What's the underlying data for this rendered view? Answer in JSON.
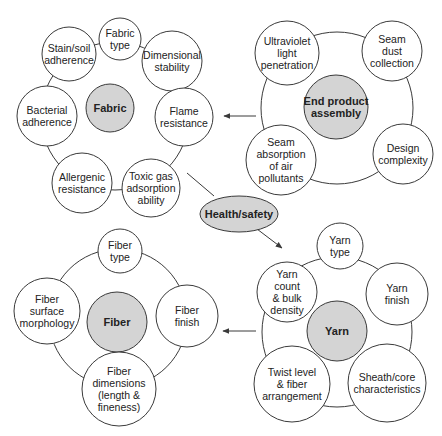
{
  "colors": {
    "line": "#3a3a3a",
    "hub_fill": "#d4d4d4",
    "node_fill": "#ffffff"
  },
  "center": {
    "label": "Health/safety",
    "cx": 239,
    "cy": 214,
    "rx": 39,
    "ry": 18
  },
  "clusters": [
    {
      "id": "fabric",
      "ring": {
        "cx": 115,
        "cy": 116,
        "r": 74
      },
      "hub": {
        "label": "Fabric",
        "cx": 110,
        "cy": 108,
        "r": 24
      },
      "nodes": [
        {
          "label": "Fabric\ntype",
          "cx": 120,
          "cy": 39,
          "r": 21
        },
        {
          "label": "Dimensional\nstability",
          "cx": 172,
          "cy": 61,
          "r": 30
        },
        {
          "label": "Flame\nresistance",
          "cx": 184,
          "cy": 117,
          "r": 29
        },
        {
          "label": "Toxic gas\nadsorption\nability",
          "cx": 151,
          "cy": 188,
          "r": 29
        },
        {
          "label": "Allergenic\nresistance",
          "cx": 82,
          "cy": 183,
          "r": 30
        },
        {
          "label": "Bacterial\nadherence",
          "cx": 47,
          "cy": 116,
          "r": 30
        },
        {
          "label": "Stain/soil\nadherence",
          "cx": 69,
          "cy": 54,
          "r": 27
        }
      ]
    },
    {
      "id": "end-product-assembly",
      "ring": {
        "cx": 337,
        "cy": 108,
        "r": 76
      },
      "hub": {
        "label": "End product\nassembly",
        "cx": 336,
        "cy": 107,
        "r": 32
      },
      "nodes": [
        {
          "label": "Ultraviolet\nlight\npenetration",
          "cx": 287,
          "cy": 53,
          "r": 32
        },
        {
          "label": "Seam\ndust\ncollection",
          "cx": 392,
          "cy": 51,
          "r": 30
        },
        {
          "label": "Design\ncomplexity",
          "cx": 403,
          "cy": 154,
          "r": 30
        },
        {
          "label": "Seam\nabsorption\nof air\npollutants",
          "cx": 281,
          "cy": 160,
          "r": 35
        }
      ]
    },
    {
      "id": "fiber",
      "ring": {
        "cx": 118,
        "cy": 318,
        "r": 69
      },
      "hub": {
        "label": "Fiber",
        "cx": 117,
        "cy": 322,
        "r": 30
      },
      "nodes": [
        {
          "label": "Fiber\ntype",
          "cx": 120,
          "cy": 251,
          "r": 22
        },
        {
          "label": "Fiber\nfinish",
          "cx": 187,
          "cy": 316,
          "r": 31
        },
        {
          "label": "Fiber\ndimensions\n(length &\nfineness)",
          "cx": 119,
          "cy": 389,
          "r": 37
        },
        {
          "label": "Fiber\nsurface\nmorphology",
          "cx": 47,
          "cy": 311,
          "r": 33
        }
      ]
    },
    {
      "id": "yarn",
      "ring": {
        "cx": 337,
        "cy": 332,
        "r": 75
      },
      "hub": {
        "label": "Yarn",
        "cx": 337,
        "cy": 331,
        "r": 30
      },
      "nodes": [
        {
          "label": "Yarn\ntype",
          "cx": 340,
          "cy": 246,
          "r": 23
        },
        {
          "label": "Yarn\nfinish",
          "cx": 397,
          "cy": 294,
          "r": 31
        },
        {
          "label": "Sheath/core\ncharacteristics",
          "cx": 387,
          "cy": 383,
          "r": 39
        },
        {
          "label": "Twist level\n& fiber\narrangement",
          "cx": 292,
          "cy": 384,
          "r": 38
        },
        {
          "label": "Yarn\ncount\n& bulk\ndensity",
          "cx": 287,
          "cy": 292,
          "r": 30
        }
      ]
    }
  ],
  "connectors": [
    {
      "from": "end-product-assembly",
      "to": "fabric",
      "x1": 256,
      "y1": 116,
      "x2": 224,
      "y2": 116,
      "arrow": true
    },
    {
      "from": "fabric",
      "to": "health-safety",
      "x1": 187,
      "y1": 173,
      "x2": 214,
      "y2": 196,
      "arrow": false
    },
    {
      "from": "health-safety",
      "to": "yarn",
      "x1": 257,
      "y1": 229,
      "x2": 282,
      "y2": 248,
      "arrow": true
    },
    {
      "from": "yarn",
      "to": "fiber",
      "x1": 256,
      "y1": 331,
      "x2": 223,
      "y2": 331,
      "arrow": true
    }
  ]
}
